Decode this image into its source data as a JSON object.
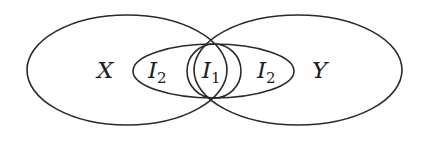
{
  "diagram": {
    "type": "venn",
    "stroke_color": "#2a2a2a",
    "background": "#ffffff",
    "regions": [
      {
        "id": "X",
        "label": "X",
        "subscript": "",
        "shape": "ellipse",
        "cx": 127,
        "cy": 70,
        "rx": 100,
        "ry": 55
      },
      {
        "id": "Y",
        "label": "Y",
        "subscript": "",
        "shape": "ellipse",
        "cx": 298,
        "cy": 70,
        "rx": 104,
        "ry": 55
      },
      {
        "id": "I2",
        "label": "I",
        "subscript": "2",
        "shape": "ellipse",
        "cx": 213.5,
        "cy": 71,
        "rx": 80.5,
        "ry": 27
      },
      {
        "id": "I1",
        "label": "I",
        "subscript": "1",
        "shape": "circle",
        "cx": 214,
        "cy": 71,
        "r": 27
      }
    ],
    "labels": [
      {
        "id": "label-x",
        "text": "X",
        "sub": "",
        "x": 97,
        "y": 78
      },
      {
        "id": "label-i2-left",
        "text": "I",
        "sub": "2",
        "x": 148,
        "y": 78
      },
      {
        "id": "label-i1",
        "text": "I",
        "sub": "1",
        "x": 202,
        "y": 78
      },
      {
        "id": "label-i2-right",
        "text": "I",
        "sub": "2",
        "x": 257,
        "y": 78
      },
      {
        "id": "label-y",
        "text": "Y",
        "sub": "",
        "x": 312,
        "y": 78
      }
    ]
  }
}
